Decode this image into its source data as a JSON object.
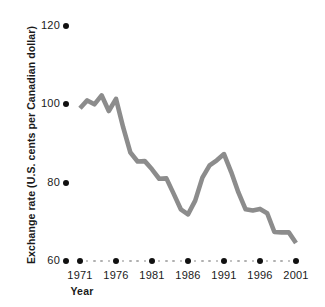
{
  "chart_data": {
    "type": "line",
    "title": "",
    "xlabel": "Year",
    "ylabel": "Exchange rate (U.S. cents per Canadian dollar)",
    "xlim": [
      1971,
      2001
    ],
    "ylim": [
      60,
      120
    ],
    "yticks": [
      120,
      100,
      80,
      60
    ],
    "xticks": [
      1971,
      1976,
      1981,
      1986,
      1991,
      1996,
      2001
    ],
    "grid": false,
    "legend": null,
    "line_color": "#8c8c8c",
    "text_color": "#1a1a1a",
    "dot_color": "#111111",
    "minor_dot_color": "#b0b0b0",
    "x": [
      1971,
      1972,
      1973,
      1974,
      1975,
      1976,
      1977,
      1978,
      1979,
      1980,
      1981,
      1982,
      1983,
      1984,
      1985,
      1986,
      1987,
      1988,
      1989,
      1990,
      1991,
      1992,
      1993,
      1994,
      1995,
      1996,
      1997,
      1998,
      1999,
      2000,
      2001
    ],
    "values": [
      99.0,
      101.0,
      100.0,
      102.3,
      98.3,
      101.4,
      94.1,
      87.7,
      85.4,
      85.5,
      83.4,
      81.0,
      81.1,
      77.2,
      73.2,
      71.9,
      75.4,
      81.3,
      84.4,
      85.7,
      87.3,
      82.7,
      77.5,
      73.2,
      72.9,
      73.3,
      72.2,
      67.4,
      67.3,
      67.3,
      64.6
    ],
    "annotations": []
  }
}
